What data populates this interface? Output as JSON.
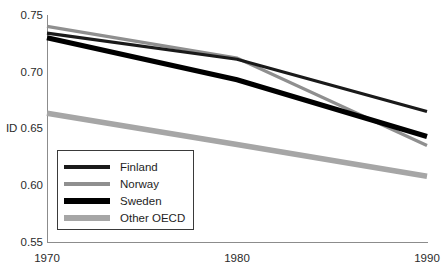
{
  "chart_data": {
    "type": "line",
    "title": "",
    "xlabel": "",
    "ylabel": "ID",
    "x": [
      1970,
      1980,
      1990
    ],
    "xtick_labels": [
      "1970",
      "1980",
      "1990"
    ],
    "ytick_labels": [
      "0.75",
      "0.70",
      "ID 0.65",
      "0.60",
      "0.55"
    ],
    "ytick_values": [
      0.75,
      0.7,
      0.65,
      0.6,
      0.55
    ],
    "ylim": [
      0.55,
      0.75
    ],
    "xlim": [
      1970,
      1990
    ],
    "grid": false,
    "legend_position": "lower-left-inside",
    "series": [
      {
        "name": "Finland",
        "values": [
          0.734,
          0.711,
          0.665
        ],
        "color": "#1a1a1a",
        "width": 3.2
      },
      {
        "name": "Norway",
        "values": [
          0.74,
          0.712,
          0.635
        ],
        "color": "#8f8f8f",
        "width": 3.2
      },
      {
        "name": "Sweden",
        "values": [
          0.73,
          0.693,
          0.643
        ],
        "color": "#000000",
        "width": 5.2
      },
      {
        "name": "Other OECD",
        "values": [
          0.6635,
          0.636,
          0.608
        ],
        "color": "#a6a6a6",
        "width": 5.6
      }
    ]
  },
  "axis": {
    "y_ticks": [
      {
        "label": "0.75"
      },
      {
        "label": "0.70"
      },
      {
        "label": "ID 0.65"
      },
      {
        "label": "0.60"
      },
      {
        "label": "0.55"
      }
    ],
    "x_ticks": [
      {
        "label": "1970"
      },
      {
        "label": "1980"
      },
      {
        "label": "1990"
      }
    ],
    "axis_color": "#8c8c8c"
  },
  "legend": {
    "items": [
      {
        "label": "Finland"
      },
      {
        "label": "Norway"
      },
      {
        "label": "Sweden"
      },
      {
        "label": "Other OECD"
      }
    ],
    "border_color": "#3a3a3a",
    "background": "#ffffff"
  }
}
